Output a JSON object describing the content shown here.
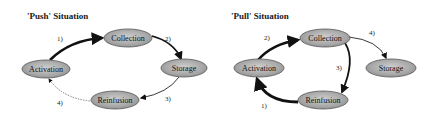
{
  "diagrams": [
    {
      "title": "'Push' Situation",
      "nodes": {
        "collection": "Collection",
        "storage": "Storage",
        "activation": "Activation",
        "reinfusion": "Reinfusion"
      },
      "steps": {
        "s1": "1)",
        "s2": "2)",
        "s3": "3)",
        "s4": "4)"
      },
      "edges": [
        {
          "from": "Activation",
          "to": "Collection",
          "label": "1)",
          "weight": "thick"
        },
        {
          "from": "Collection",
          "to": "Storage",
          "label": "2)",
          "weight": "thick"
        },
        {
          "from": "Storage",
          "to": "Reinfusion",
          "label": "3)",
          "weight": "thin"
        },
        {
          "from": "Reinfusion",
          "to": "Activation",
          "label": "4)",
          "weight": "dashed"
        }
      ]
    },
    {
      "title": "'Pull' Situation",
      "nodes": {
        "collection": "Collection",
        "storage": "Storage",
        "activation": "Activation",
        "reinfusion": "Reinfusion"
      },
      "steps": {
        "s1": "1)",
        "s2": "2)",
        "s3": "3)",
        "s4": "4)"
      },
      "edges": [
        {
          "from": "Reinfusion",
          "to": "Activation",
          "label": "1)",
          "weight": "thick"
        },
        {
          "from": "Activation",
          "to": "Collection",
          "label": "2)",
          "weight": "thick"
        },
        {
          "from": "Collection",
          "to": "Reinfusion",
          "label": "3)",
          "weight": "medium"
        },
        {
          "from": "Collection",
          "to": "Storage",
          "label": "4)",
          "weight": "thin"
        }
      ]
    }
  ],
  "colors": {
    "node_fill": "#a9a9a9",
    "node_stroke": "#555555",
    "edge": "#111111"
  }
}
